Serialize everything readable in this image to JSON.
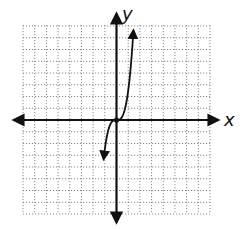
{
  "chart_data": {
    "type": "line",
    "title": "",
    "xlabel": "x",
    "ylabel": "y",
    "xlim": [
      -8,
      8
    ],
    "ylim": [
      -8,
      8
    ],
    "grid": true,
    "grid_style": "dotted",
    "legend": null,
    "tick_labels": false,
    "series": [
      {
        "name": "f(x)",
        "description": "cubic-shaped curve through origin, steep, with arrows at both ends",
        "function": "y = 2.5 * x^3",
        "points": [
          {
            "x": -1.1,
            "y": -7.8
          },
          {
            "x": -1.0,
            "y": -2.5
          },
          {
            "x": -0.8,
            "y": -1.3
          },
          {
            "x": -0.5,
            "y": -0.3
          },
          {
            "x": 0,
            "y": 0
          },
          {
            "x": 0.5,
            "y": 0.3
          },
          {
            "x": 0.8,
            "y": 1.3
          },
          {
            "x": 1.0,
            "y": 2.5
          },
          {
            "x": 1.3,
            "y": 5.5
          },
          {
            "x": 1.45,
            "y": 7.8
          }
        ],
        "marked_point": {
          "x": 0,
          "y": 0
        },
        "arrows": "both-ends",
        "color": "#111111"
      }
    ]
  },
  "axes": {
    "x_label": "x",
    "y_label": "y",
    "color": "#111111"
  },
  "grid": {
    "columns": 16,
    "rows": 16,
    "color": "#888888"
  }
}
